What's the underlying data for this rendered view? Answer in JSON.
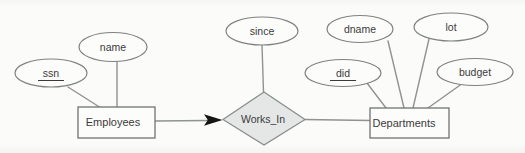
{
  "diagram": {
    "type": "er-diagram",
    "relationship": {
      "label": "Works_In"
    },
    "entities": [
      {
        "label": "Employees"
      },
      {
        "label": "Departments"
      }
    ],
    "attributes": [
      {
        "label": "ssn",
        "key": true,
        "attached_to": "Employees"
      },
      {
        "label": "name",
        "key": false,
        "attached_to": "Employees"
      },
      {
        "label": "since",
        "key": false,
        "attached_to": "Works_In"
      },
      {
        "label": "did",
        "key": true,
        "attached_to": "Departments"
      },
      {
        "label": "dname",
        "key": false,
        "attached_to": "Departments"
      },
      {
        "label": "lot",
        "key": false,
        "attached_to": "Departments"
      },
      {
        "label": "budget",
        "key": false,
        "attached_to": "Departments"
      }
    ],
    "colors": {
      "background": "#fbfbf9",
      "line": "#8f9392",
      "shape_border": "#6f7472",
      "diamond_fill": "#e4e7e6",
      "text": "#3b3b3b",
      "arrowhead": "#161616"
    }
  }
}
